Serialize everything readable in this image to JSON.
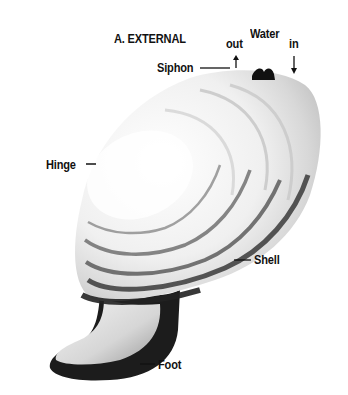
{
  "figure": {
    "title": "A. EXTERNAL",
    "labels": {
      "siphon": "Siphon",
      "out": "out",
      "water": "Water",
      "in": "in",
      "hinge": "Hinge",
      "shell": "Shell",
      "foot": "Foot"
    },
    "arrows": {
      "out": "up",
      "in": "down"
    }
  },
  "colors": {
    "background": "#ffffff",
    "text": "#111111",
    "shell_light": "#f2f2f2",
    "shell_mid": "#c8c8c8",
    "shell_dark": "#2a2a2a",
    "foot_light": "#e6e6e6",
    "foot_dark": "#1a1a1a"
  }
}
